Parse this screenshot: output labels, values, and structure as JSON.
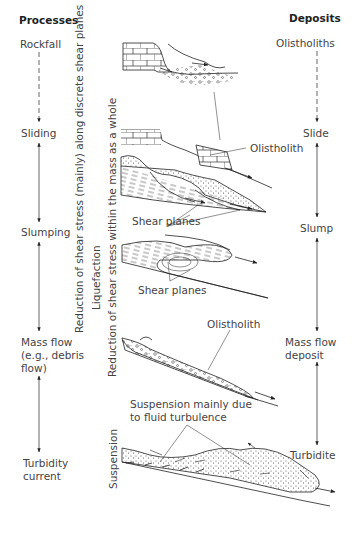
{
  "headers": {
    "processes": "Processes",
    "deposits": "Deposits"
  },
  "processes": [
    {
      "label": "Rockfall"
    },
    {
      "label": "Sliding"
    },
    {
      "label": "Slumping"
    },
    {
      "label_lines": [
        "Mass flow",
        "(e.g., debris",
        "flow)"
      ]
    },
    {
      "label_lines": [
        "Turbidity",
        "current"
      ]
    }
  ],
  "deposits": [
    {
      "label": "Olistholiths"
    },
    {
      "label": "Slide"
    },
    {
      "label": "Slump"
    },
    {
      "label_lines": [
        "Mass flow",
        "deposit"
      ]
    },
    {
      "label": "Turbidite"
    }
  ],
  "vertical_labels": {
    "discrete_shear": "Reduction of shear stress (mainly) along discrete shear planes",
    "liquefaction": "Liquefaction",
    "mass_whole": "Reduction of shear stress within the mass as a whole",
    "suspension": "Suspension"
  },
  "annotations": {
    "olistholith_slide": "Olistholith",
    "shear_planes_1": "Shear planes",
    "shear_planes_2": "Shear planes",
    "olistholith_massflow": "Olistholith",
    "suspension_note_lines": [
      "Suspension mainly due",
      "to fluid turbulence"
    ]
  },
  "colors": {
    "line": "#222222",
    "text": "#444444"
  }
}
